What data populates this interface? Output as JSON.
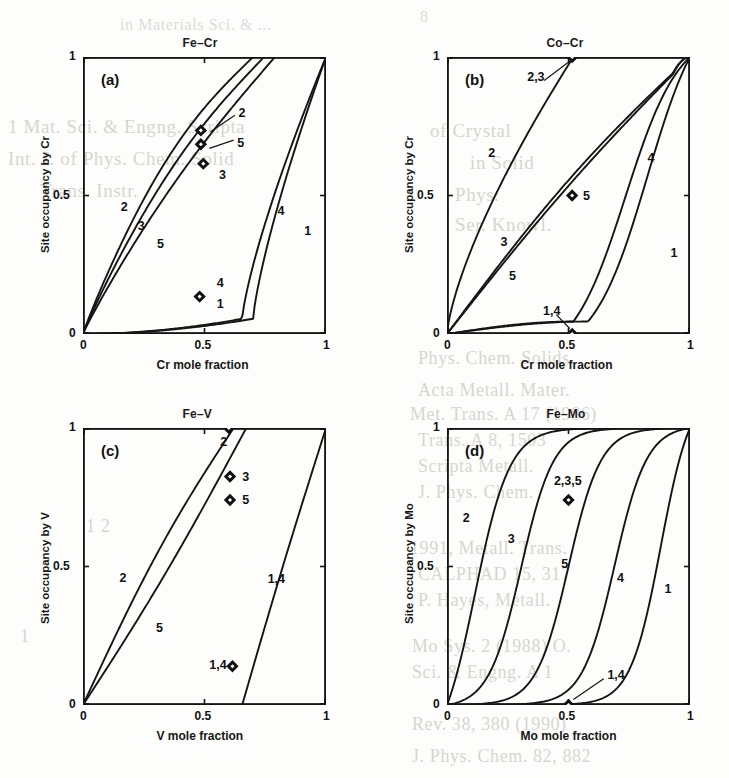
{
  "figure": {
    "caption_visible": false,
    "line_color": "#151515",
    "marker_color": "#111111",
    "background": "#fdfdfb"
  },
  "ghost_text": [
    {
      "text": "1 Mat. Sci. & Engng.  Scripta",
      "x": 8,
      "y": 116,
      "size": 19
    },
    {
      "text": "Int. J. of Phys. Chem. Solid",
      "x": 8,
      "y": 148,
      "size": 19
    },
    {
      "text": "Trans. Instr.",
      "x": 40,
      "y": 180,
      "size": 19
    },
    {
      "text": "8",
      "x": 420,
      "y": 8,
      "size": 16
    },
    {
      "text": "in  Materials  Sci. & ...",
      "x": 120,
      "y": 16,
      "size": 16
    },
    {
      "text": "of Crystal",
      "x": 430,
      "y": 120,
      "size": 19
    },
    {
      "text": "in Solid",
      "x": 470,
      "y": 152,
      "size": 19
    },
    {
      "text": "Phys.",
      "x": 455,
      "y": 184,
      "size": 19
    },
    {
      "text": "Ser. Knowl.",
      "x": 455,
      "y": 214,
      "size": 19
    },
    {
      "text": "Phys.  Chem.  Solids",
      "x": 418,
      "y": 348,
      "size": 18
    },
    {
      "text": "Acta Metall.   Mater.",
      "x": 418,
      "y": 380,
      "size": 18
    },
    {
      "text": "Met. Trans.  A 17  (1986)",
      "x": 410,
      "y": 404,
      "size": 18
    },
    {
      "text": "Trans. A 8, 1503",
      "x": 418,
      "y": 430,
      "size": 18
    },
    {
      "text": "Scripta Metall.",
      "x": 418,
      "y": 456,
      "size": 18
    },
    {
      "text": "J. Phys. Chem.",
      "x": 418,
      "y": 482,
      "size": 18
    },
    {
      "text": "1991,  Metall.   Trans.",
      "x": 410,
      "y": 538,
      "size": 18
    },
    {
      "text": "CALPHAD  15, 317",
      "x": 418,
      "y": 564,
      "size": 18
    },
    {
      "text": "P.  Hayes, Metall.",
      "x": 418,
      "y": 590,
      "size": 18
    },
    {
      "text": "Mo  Sys. 2 (1988)  O.",
      "x": 412,
      "y": 636,
      "size": 18
    },
    {
      "text": "Sci. & Engng.  A 1",
      "x": 412,
      "y": 662,
      "size": 18
    },
    {
      "text": "Rev. 38, 380 (1990)",
      "x": 412,
      "y": 714,
      "size": 18
    },
    {
      "text": "J. Phys. Chem. 82, 882",
      "x": 412,
      "y": 746,
      "size": 18
    },
    {
      "text": "1 2",
      "x": 86,
      "y": 516,
      "size": 18
    },
    {
      "text": "1",
      "x": 20,
      "y": 626,
      "size": 18
    }
  ],
  "panels": [
    {
      "id": "a",
      "tag": "(a)",
      "title": "Fe–Cr",
      "xlabel": "Cr mole fraction",
      "ylabel": "Site occupancy by Cr",
      "xticks": [
        "0",
        "0.5",
        "1"
      ],
      "yticks": [
        "0",
        "0.5",
        "1"
      ],
      "xlim": [
        0,
        1
      ],
      "ylim": [
        0,
        1
      ],
      "curve_labels": [
        {
          "text": "2",
          "x": 0.155,
          "y": 0.455
        },
        {
          "text": "3",
          "x": 0.225,
          "y": 0.385
        },
        {
          "text": "5",
          "x": 0.305,
          "y": 0.32
        },
        {
          "text": "4",
          "x": 0.8,
          "y": 0.44
        },
        {
          "text": "1",
          "x": 0.91,
          "y": 0.37
        },
        {
          "text": "2",
          "x": 0.64,
          "y": 0.795
        },
        {
          "text": "5",
          "x": 0.635,
          "y": 0.685
        },
        {
          "text": "3",
          "x": 0.56,
          "y": 0.57
        },
        {
          "text": "4",
          "x": 0.55,
          "y": 0.18
        },
        {
          "text": "1",
          "x": 0.55,
          "y": 0.105
        }
      ],
      "markers": [
        {
          "x": 0.485,
          "y": 0.735
        },
        {
          "x": 0.485,
          "y": 0.685
        },
        {
          "x": 0.495,
          "y": 0.615
        },
        {
          "x": 0.48,
          "y": 0.135
        }
      ],
      "leaders": [
        {
          "x1": 0.525,
          "y1": 0.73,
          "x2": 0.625,
          "y2": 0.79
        },
        {
          "x1": 0.52,
          "y1": 0.67,
          "x2": 0.62,
          "y2": 0.7
        }
      ],
      "chart_data": {
        "type": "line",
        "series": [
          {
            "name": "1",
            "kind": "low",
            "onset": 0.7,
            "width": 0.16
          },
          {
            "name": "4",
            "kind": "low",
            "onset": 0.655,
            "width": 0.15
          },
          {
            "name": "2",
            "kind": "high",
            "sat": 0.7,
            "bow": 0.115
          },
          {
            "name": "3",
            "kind": "high",
            "sat": 0.745,
            "bow": 0.085
          },
          {
            "name": "5",
            "kind": "high",
            "sat": 0.79,
            "bow": 0.045
          }
        ]
      }
    },
    {
      "id": "b",
      "tag": "(b)",
      "title": "Co–Cr",
      "xlabel": "Cr mole fraction",
      "ylabel": "Site occupancy by Cr",
      "xticks": [
        "0",
        "0.5",
        "1"
      ],
      "yticks": [
        "0",
        "0.5",
        "1"
      ],
      "xlim": [
        0,
        1
      ],
      "ylim": [
        0,
        1
      ],
      "curve_labels": [
        {
          "text": "2",
          "x": 0.17,
          "y": 0.65
        },
        {
          "text": "3",
          "x": 0.22,
          "y": 0.33
        },
        {
          "text": "5",
          "x": 0.255,
          "y": 0.205
        },
        {
          "text": "4",
          "x": 0.825,
          "y": 0.63
        },
        {
          "text": "1",
          "x": 0.92,
          "y": 0.29
        },
        {
          "text": "2,3",
          "x": 0.33,
          "y": 0.925
        },
        {
          "text": "1,4",
          "x": 0.395,
          "y": 0.08
        },
        {
          "text": "5",
          "x": 0.56,
          "y": 0.495
        }
      ],
      "markers": [
        {
          "x": 0.515,
          "y": 1.0
        },
        {
          "x": 0.515,
          "y": 0.5
        },
        {
          "x": 0.515,
          "y": 0.0
        }
      ],
      "leaders": [
        {
          "x1": 0.4,
          "y1": 0.915,
          "x2": 0.505,
          "y2": 0.985
        },
        {
          "x1": 0.45,
          "y1": 0.07,
          "x2": 0.505,
          "y2": 0.02
        }
      ],
      "chart_data": {
        "type": "line",
        "series": [
          {
            "name": "2",
            "kind": "fast",
            "sat": 0.52
          },
          {
            "name": "3",
            "kind": "diag",
            "bow": 0.055
          },
          {
            "name": "5",
            "kind": "diag",
            "bow": 0.035
          },
          {
            "name": "4",
            "kind": "late",
            "onset": 0.52,
            "mid": 0.735
          },
          {
            "name": "1",
            "kind": "late",
            "onset": 0.58,
            "mid": 0.825
          }
        ]
      }
    },
    {
      "id": "c",
      "tag": "(c)",
      "title": "Fe–V",
      "xlabel": "V mole fraction",
      "ylabel": "Site occupancy by V",
      "xticks": [
        "0",
        "0.5",
        "1"
      ],
      "yticks": [
        "0",
        "0.5",
        "1"
      ],
      "xlim": [
        0,
        1
      ],
      "ylim": [
        0,
        1
      ],
      "curve_labels": [
        {
          "text": "2",
          "x": 0.15,
          "y": 0.455
        },
        {
          "text": "5",
          "x": 0.3,
          "y": 0.275
        },
        {
          "text": "1,4",
          "x": 0.76,
          "y": 0.45
        },
        {
          "text": "2",
          "x": 0.565,
          "y": 0.945
        },
        {
          "text": "3",
          "x": 0.655,
          "y": 0.82
        },
        {
          "text": "5",
          "x": 0.655,
          "y": 0.735
        },
        {
          "text": "1,4",
          "x": 0.52,
          "y": 0.14
        }
      ],
      "markers": [
        {
          "x": 0.6,
          "y": 1.0
        },
        {
          "x": 0.605,
          "y": 0.825
        },
        {
          "x": 0.605,
          "y": 0.74
        },
        {
          "x": 0.615,
          "y": 0.14
        }
      ],
      "leaders": [],
      "chart_data": {
        "type": "line",
        "series": [
          {
            "name": "2",
            "kind": "rise",
            "x0": 0.0,
            "x1": 0.62,
            "bow": 0.055
          },
          {
            "name": "5",
            "kind": "rise",
            "x0": 0.0,
            "x1": 0.672,
            "bow": -0.03
          },
          {
            "name": "1,4",
            "kind": "rise",
            "x0": 0.655,
            "x1": 1.0,
            "bow": 0.015
          }
        ]
      }
    },
    {
      "id": "d",
      "tag": "(d)",
      "title": "Fe–Mo",
      "xlabel": "Mo mole fraction",
      "ylabel": "Site occupancy by Mo",
      "xticks": [
        "0",
        "0.5",
        "1"
      ],
      "yticks": [
        "0",
        "0.5",
        "1"
      ],
      "xlim": [
        0,
        1
      ],
      "ylim": [
        0,
        1
      ],
      "curve_labels": [
        {
          "text": "2",
          "x": 0.065,
          "y": 0.67
        },
        {
          "text": "3",
          "x": 0.25,
          "y": 0.595
        },
        {
          "text": "5",
          "x": 0.47,
          "y": 0.505
        },
        {
          "text": "4",
          "x": 0.7,
          "y": 0.455
        },
        {
          "text": "1",
          "x": 0.895,
          "y": 0.415
        },
        {
          "text": "2,3,5",
          "x": 0.44,
          "y": 0.805
        },
        {
          "text": "1,4",
          "x": 0.66,
          "y": 0.105
        }
      ],
      "markers": [
        {
          "x": 0.5,
          "y": 0.74
        },
        {
          "x": 0.5,
          "y": 0.0
        }
      ],
      "leaders": [
        {
          "x1": 0.645,
          "y1": 0.095,
          "x2": 0.52,
          "y2": 0.02
        }
      ],
      "chart_data": {
        "type": "line",
        "series": [
          {
            "name": "2",
            "kind": "sigmoid",
            "mid": 0.115,
            "steep": 14
          },
          {
            "name": "3",
            "kind": "sigmoid",
            "mid": 0.305,
            "steep": 15
          },
          {
            "name": "5",
            "kind": "sigmoid",
            "mid": 0.5,
            "steep": 15
          },
          {
            "name": "4",
            "kind": "sigmoid",
            "mid": 0.69,
            "steep": 15
          },
          {
            "name": "1",
            "kind": "sigmoid",
            "mid": 0.88,
            "steep": 16
          }
        ]
      }
    }
  ]
}
